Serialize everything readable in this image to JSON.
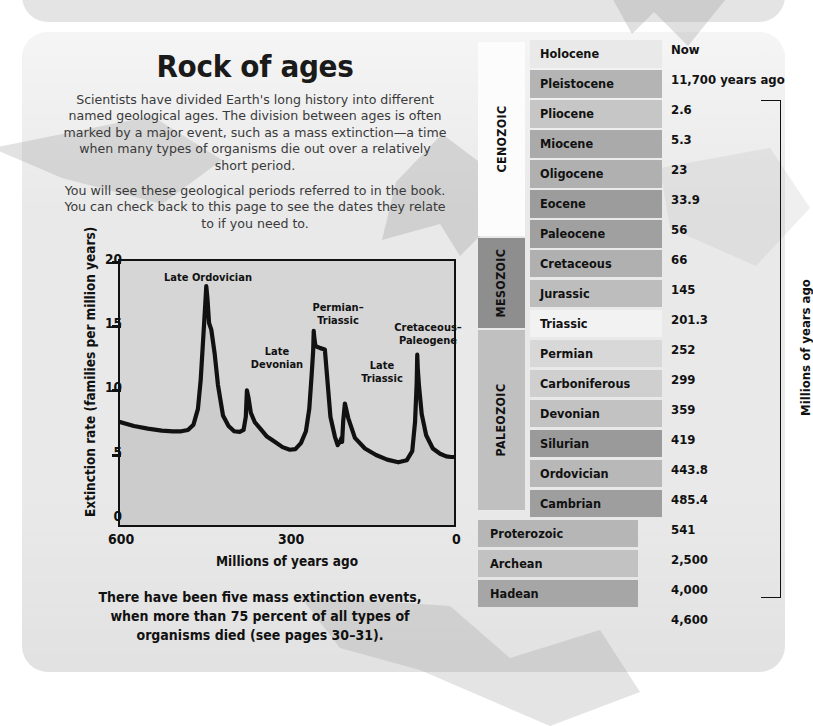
{
  "page": {
    "title": "Rock of ages",
    "intro_paragraph_1": "Scientists have divided Earth's long history into different named geological ages. The division between ages is often marked by a major event, such as a mass extinction—a time when many types of organisms die out over a relatively short period.",
    "intro_paragraph_2": "You will see these geological periods referred to in the book. You can check back to this page to see the dates they relate to if you need to.",
    "caption": "There have been five mass extinction events, when more than 75 percent of all types of organisms died (see pages 30–31)."
  },
  "colors": {
    "card_background": "#e9e9e9",
    "plot_background": "#d6d6d6",
    "axis": "#111111",
    "band_light": "#e2e2e2",
    "band_mid": "#c8c8c8",
    "band_dark": "#a8a8a8",
    "band_white": "#f6f6f6",
    "era_cenozoic": "#fcfcfc",
    "era_mesozoic": "#8e8e8e",
    "era_paleozoic": "#c0c0c0"
  },
  "chart_data": {
    "type": "area",
    "title": "",
    "xlabel": "Millions of years ago",
    "ylabel": "Extinction rate (families per million years)",
    "xlim": [
      600,
      0
    ],
    "ylim": [
      0,
      20
    ],
    "xticks": [
      600,
      300,
      0
    ],
    "yticks": [
      0,
      5,
      10,
      15,
      20
    ],
    "grid": false,
    "x_reversed": true,
    "annotations": [
      {
        "label": "Late Ordovician",
        "x": 445,
        "y": 18.1
      },
      {
        "label": "Late\nDevonian",
        "x": 372,
        "y": 10.2
      },
      {
        "label": "Permian–\nTriassic",
        "x": 252,
        "y": 14.7
      },
      {
        "label": "Late\nTriassic",
        "x": 201,
        "y": 9.2
      },
      {
        "label": "Cretaceous–\nPaleogene",
        "x": 66,
        "y": 12.9
      }
    ],
    "x": [
      600,
      575,
      550,
      525,
      505,
      490,
      478,
      468,
      460,
      455,
      450,
      447,
      445,
      443,
      440,
      436,
      430,
      424,
      415,
      405,
      395,
      385,
      378,
      374,
      372,
      369,
      365,
      358,
      348,
      336,
      322,
      308,
      295,
      285,
      275,
      266,
      260,
      256,
      253,
      252,
      251,
      249,
      246,
      240,
      232,
      222,
      214,
      209,
      205,
      202,
      201,
      199,
      196,
      190,
      178,
      160,
      140,
      120,
      100,
      85,
      75,
      70,
      67,
      66,
      65,
      63,
      58,
      50,
      38,
      25,
      14,
      5,
      0
    ],
    "y": [
      7.8,
      7.5,
      7.3,
      7.15,
      7.1,
      7.1,
      7.2,
      7.6,
      8.8,
      11.0,
      14.5,
      16.6,
      18.1,
      17.2,
      15.3,
      14.8,
      13.0,
      10.6,
      8.3,
      7.5,
      7.1,
      7.05,
      7.2,
      8.2,
      10.2,
      9.6,
      8.5,
      7.8,
      7.3,
      6.7,
      6.3,
      5.9,
      5.7,
      5.75,
      6.2,
      7.1,
      8.8,
      11.2,
      13.2,
      14.7,
      14.2,
      13.6,
      13.5,
      13.4,
      13.3,
      8.2,
      6.7,
      6.05,
      6.3,
      6.6,
      6.3,
      7.9,
      9.2,
      8.1,
      6.6,
      5.8,
      5.3,
      4.95,
      4.75,
      4.9,
      5.6,
      7.8,
      10.8,
      12.9,
      11.8,
      10.6,
      8.4,
      6.8,
      5.8,
      5.4,
      5.2,
      5.15,
      5.15
    ]
  },
  "geologic_column": {
    "eras": [
      {
        "name": "CENOZOIC",
        "top": 2,
        "height": 194,
        "color": "#fcfcfc"
      },
      {
        "name": "MESOZOIC",
        "top": 198,
        "height": 90,
        "color": "#8e8e8e"
      },
      {
        "name": "PALEOZOIC",
        "top": 290,
        "height": 180,
        "color": "#c0c0c0"
      }
    ],
    "rows": [
      {
        "name": "Holocene",
        "shade": "#e9e9e9",
        "wide": false
      },
      {
        "name": "Pleistocene",
        "shade": "#b4b4b4",
        "wide": false
      },
      {
        "name": "Pliocene",
        "shade": "#c6c6c6",
        "wide": false
      },
      {
        "name": "Miocene",
        "shade": "#aaaaaa",
        "wide": false
      },
      {
        "name": "Oligocene",
        "shade": "#b0b0b0",
        "wide": false
      },
      {
        "name": "Eocene",
        "shade": "#9c9c9c",
        "wide": false
      },
      {
        "name": "Paleocene",
        "shade": "#a0a0a0",
        "wide": false
      },
      {
        "name": "Cretaceous",
        "shade": "#b0b0b0",
        "wide": false
      },
      {
        "name": "Jurassic",
        "shade": "#bdbdbd",
        "wide": false
      },
      {
        "name": "Triassic",
        "shade": "#f2f2f2",
        "wide": false
      },
      {
        "name": "Permian",
        "shade": "#d8d8d8",
        "wide": false
      },
      {
        "name": "Carboniferous",
        "shade": "#cfcfcf",
        "wide": false
      },
      {
        "name": "Devonian",
        "shade": "#c2c2c2",
        "wide": false
      },
      {
        "name": "Silurian",
        "shade": "#9a9a9a",
        "wide": false
      },
      {
        "name": "Ordovician",
        "shade": "#b8b8b8",
        "wide": false
      },
      {
        "name": "Cambrian",
        "shade": "#9e9e9e",
        "wide": false
      },
      {
        "name": "Proterozoic",
        "shade": "#b6b6b6",
        "wide": true
      },
      {
        "name": "Archean",
        "shade": "#c2c2c2",
        "wide": true
      },
      {
        "name": "Hadean",
        "shade": "#a6a6a6",
        "wide": true
      }
    ],
    "dates": [
      {
        "text": "Now",
        "top": 2
      },
      {
        "text": "11,700 years ago",
        "top": 32
      },
      {
        "text": "2.6",
        "top": 62
      },
      {
        "text": "5.3",
        "top": 92
      },
      {
        "text": "23",
        "top": 122
      },
      {
        "text": "33.9",
        "top": 152
      },
      {
        "text": "56",
        "top": 182
      },
      {
        "text": "66",
        "top": 212
      },
      {
        "text": "145",
        "top": 242
      },
      {
        "text": "201.3",
        "top": 272
      },
      {
        "text": "252",
        "top": 302
      },
      {
        "text": "299",
        "top": 332
      },
      {
        "text": "359",
        "top": 362
      },
      {
        "text": "419",
        "top": 392
      },
      {
        "text": "443.8",
        "top": 422
      },
      {
        "text": "485.4",
        "top": 452
      },
      {
        "text": "541",
        "top": 482
      },
      {
        "text": "2,500",
        "top": 512
      },
      {
        "text": "4,000",
        "top": 542
      },
      {
        "text": "4,600",
        "top": 572
      }
    ],
    "bracket_label": "Millions of years ago"
  }
}
